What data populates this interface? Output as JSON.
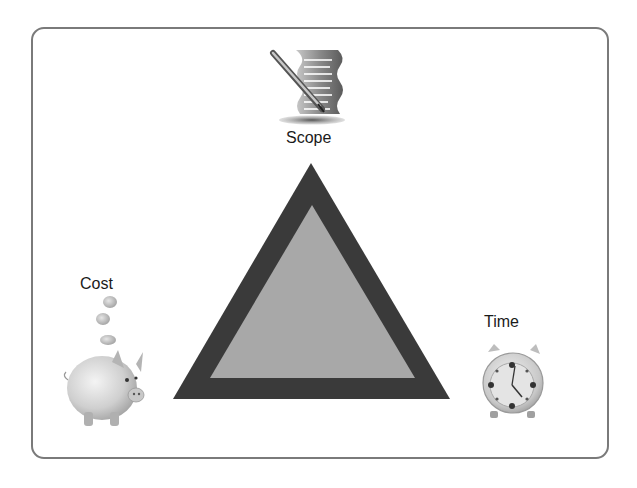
{
  "diagram": {
    "type": "triangle",
    "vertices": [
      {
        "id": "scope",
        "label": "Scope",
        "icon": "document-pen-icon",
        "position": "top"
      },
      {
        "id": "cost",
        "label": "Cost",
        "icon": "piggy-bank-icon",
        "position": "bottom-left"
      },
      {
        "id": "time",
        "label": "Time",
        "icon": "alarm-clock-icon",
        "position": "bottom-right"
      }
    ],
    "colors": {
      "triangle_outer": "#3a3a3a",
      "triangle_inner": "#a8a8a8",
      "frame_border": "#7a7a7a",
      "background": "#ffffff"
    }
  }
}
